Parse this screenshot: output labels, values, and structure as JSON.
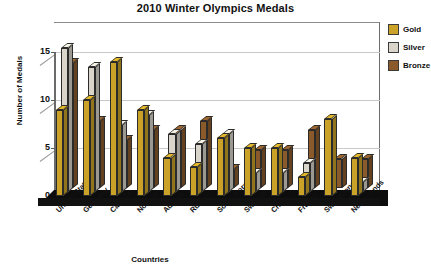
{
  "chart_data": {
    "type": "bar",
    "title": "2010 Winter Olympics Medals",
    "xlabel": "Countries",
    "ylabel": "Number of Medals",
    "ylim": [
      0,
      17
    ],
    "yticks": [
      0,
      5,
      10,
      15
    ],
    "grid": true,
    "legend_position": "right",
    "three_d": true,
    "categories": [
      "United States",
      "Germany",
      "Canada",
      "Norway",
      "Austria",
      "Russia",
      "South Korea",
      "Sweden",
      "China",
      "France",
      "Switzerland",
      "Netherlands"
    ],
    "series": [
      {
        "name": "Gold",
        "color": "#C9A227",
        "values": [
          9,
          10,
          14,
          9,
          4,
          3,
          6,
          5,
          5,
          2,
          8,
          4
        ]
      },
      {
        "name": "Silver",
        "color": "#D9D5CB",
        "values": [
          15,
          13,
          7,
          8,
          6,
          5,
          6,
          2,
          2,
          3,
          0,
          1
        ]
      },
      {
        "name": "Bronze",
        "color": "#8B5A2B",
        "values": [
          13,
          7,
          5,
          6,
          6,
          7,
          2,
          4,
          4,
          6,
          3,
          3
        ]
      }
    ]
  },
  "legend": {
    "items": [
      {
        "label": "Gold",
        "color": "#C9A227"
      },
      {
        "label": "Silver",
        "color": "#D9D5CB"
      },
      {
        "label": "Bronze",
        "color": "#8B5A2B"
      }
    ]
  },
  "axes": {
    "y_title": "Number of Medals",
    "x_title": "Countries",
    "y_tick_labels": [
      "0",
      "5",
      "10",
      "15"
    ]
  },
  "colors": {
    "background": "#FFFFFF",
    "floor": "#0D0D0D",
    "axis": "#6B6B6B",
    "grid": "#C9C9C9",
    "text": "#111111"
  }
}
